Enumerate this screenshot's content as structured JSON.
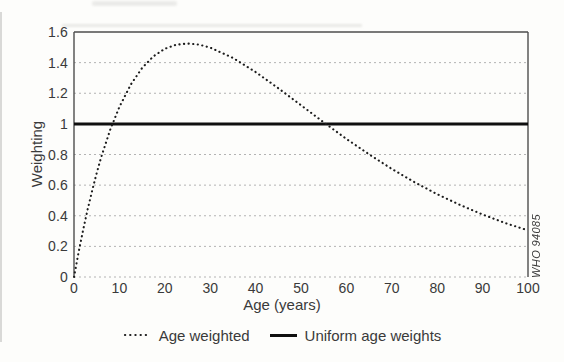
{
  "figure": {
    "watermark": "WHO 94085",
    "colors": {
      "background": "#fdfdfb",
      "text": "#3a3a3a",
      "frame": "#4d4d4d",
      "grid": "#b3b3b3",
      "series_dotted": "#1c1c1c",
      "series_solid": "#0f0f0f"
    }
  },
  "chart_data": {
    "type": "line",
    "title": "",
    "xlabel": "Age (years)",
    "ylabel": "Weighting",
    "xlim": [
      0,
      100
    ],
    "ylim": [
      0,
      1.6
    ],
    "grid": "horizontal-dashed",
    "legend_position": "bottom",
    "x_ticks": [
      0,
      10,
      20,
      30,
      40,
      50,
      60,
      70,
      80,
      90,
      100
    ],
    "x_tick_labels": [
      "0",
      "10",
      "20",
      "30",
      "40",
      "50",
      "60",
      "70",
      "80",
      "90",
      "100"
    ],
    "y_ticks": [
      0,
      0.2,
      0.4,
      0.6,
      0.8,
      1,
      1.2,
      1.4,
      1.6
    ],
    "y_tick_labels": [
      "0",
      "0.2",
      "0.4",
      "0.6",
      "0.8",
      "1",
      "1.2",
      "1.4",
      "1.6"
    ],
    "series": [
      {
        "name": "Age weighted",
        "style": "dotted",
        "x": [
          0,
          1,
          2,
          3,
          4,
          5,
          6,
          8,
          10,
          12.5,
          15,
          17.5,
          20,
          22.5,
          25,
          27.5,
          30,
          35,
          40,
          45,
          50,
          55,
          60,
          65,
          70,
          75,
          80,
          85,
          90,
          95,
          100
        ],
        "y": [
          0,
          0.159,
          0.306,
          0.441,
          0.565,
          0.679,
          0.783,
          0.963,
          1.111,
          1.257,
          1.365,
          1.441,
          1.49,
          1.517,
          1.525,
          1.518,
          1.498,
          1.431,
          1.339,
          1.233,
          1.122,
          1.01,
          0.902,
          0.801,
          0.706,
          0.619,
          0.541,
          0.471,
          0.408,
          0.352,
          0.304
        ]
      },
      {
        "name": "Uniform age weights",
        "style": "solid-bold",
        "y_constant": 1
      }
    ]
  }
}
